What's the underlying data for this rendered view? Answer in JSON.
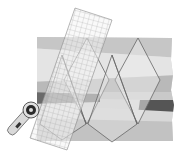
{
  "illustration": {
    "subject": "quilting: cutting diamonds from strip-pieced fabric with a rotary cutter and grid ruler",
    "colors": {
      "background": "#ffffff",
      "strip_light": "#e6e6e6",
      "strip_mid": "#c4c4c4",
      "strip_mid2": "#b3b3b3",
      "strip_dark": "#5e5e5e",
      "diamond_fill": "#ececec",
      "outline": "#6a6a6a",
      "ruler_grid": "#9a9a9a",
      "cutter_body": "#d8d8d8",
      "cutter_dark": "#2a2a2a"
    },
    "elements": [
      "fabric-strip-set",
      "diamond-cut-lines",
      "grid-ruler",
      "rotary-cutter"
    ]
  }
}
